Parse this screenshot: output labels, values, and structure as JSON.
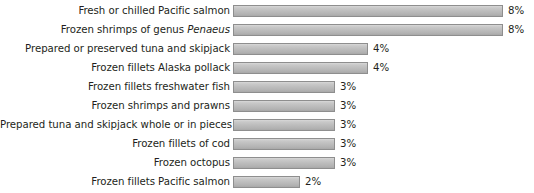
{
  "chart_data": {
    "type": "bar",
    "orientation": "horizontal",
    "title": "",
    "xlabel": "",
    "ylabel": "",
    "xlim": [
      0,
      9
    ],
    "grid": false,
    "legend": null,
    "unit": "%",
    "categories": [
      "Fresh or chilled Pacific salmon",
      "Frozen shrimps of genus Penaeus",
      "Prepared or preserved tuna and skipjack",
      "Frozen fillets Alaska pollack",
      "Frozen fillets freshwater fish",
      "Frozen shrimps and prawns",
      "Prepared tuna and skipjack whole or in pieces",
      "Frozen fillets of cod",
      "Frozen  octopus",
      "Frozen fillets Pacific salmon"
    ],
    "values": [
      8,
      8,
      4,
      4,
      3,
      3,
      3,
      3,
      3,
      2
    ],
    "value_labels": [
      "8%",
      "8%",
      "4%",
      "4%",
      "3%",
      "3%",
      "3%",
      "3%",
      "3%",
      "2%"
    ],
    "bar_color": "#bdbdbd",
    "bar_border_color": "#8e8e8e",
    "text_color": "#231f20",
    "background_color": "#ffffff"
  },
  "rows": [
    {
      "label_pre": "Fresh or chilled Pacific salmon",
      "label_em": "",
      "label_post": "",
      "value_label": "8%",
      "bar_px": 270
    },
    {
      "label_pre": "Frozen shrimps of genus ",
      "label_em": "Penaeus",
      "label_post": "",
      "value_label": "8%",
      "bar_px": 270
    },
    {
      "label_pre": "Prepared or preserved tuna and skipjack",
      "label_em": "",
      "label_post": "",
      "value_label": "4%",
      "bar_px": 135
    },
    {
      "label_pre": "Frozen fillets Alaska pollack",
      "label_em": "",
      "label_post": "",
      "value_label": "4%",
      "bar_px": 135
    },
    {
      "label_pre": "Frozen fillets freshwater fish",
      "label_em": "",
      "label_post": "",
      "value_label": "3%",
      "bar_px": 102
    },
    {
      "label_pre": "Frozen shrimps and prawns",
      "label_em": "",
      "label_post": "",
      "value_label": "3%",
      "bar_px": 102
    },
    {
      "label_pre": "Prepared tuna and skipjack whole or in pieces",
      "label_em": "",
      "label_post": "",
      "value_label": "3%",
      "bar_px": 102
    },
    {
      "label_pre": "Frozen fillets of cod",
      "label_em": "",
      "label_post": "",
      "value_label": "3%",
      "bar_px": 102
    },
    {
      "label_pre": "Frozen  octopus",
      "label_em": "",
      "label_post": "",
      "value_label": "3%",
      "bar_px": 102
    },
    {
      "label_pre": "Frozen fillets Pacific salmon",
      "label_em": "",
      "label_post": "",
      "value_label": "2%",
      "bar_px": 67
    }
  ]
}
